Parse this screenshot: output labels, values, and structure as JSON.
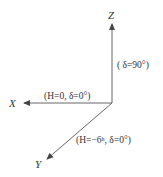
{
  "diagram": {
    "type": "coordinate-axes",
    "line_color": "#555555",
    "text_color": "#333333",
    "axes": {
      "z": {
        "label": "Z",
        "annotation": "( δ=90°)"
      },
      "x": {
        "label": "X",
        "annotation": "(H=0, δ=0°)"
      },
      "y": {
        "label": "Y",
        "annotation": "(H=−6ʰ, δ=0°)"
      }
    }
  }
}
